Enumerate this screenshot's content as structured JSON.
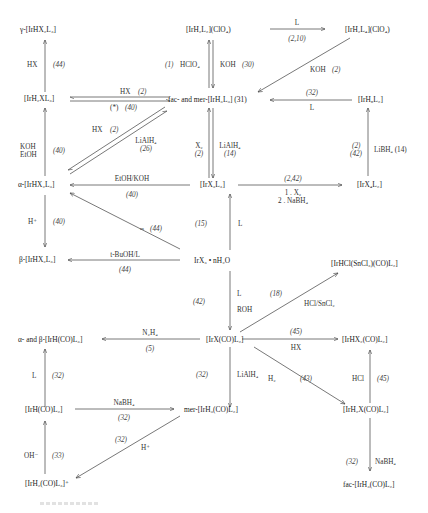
{
  "diagram": {
    "nodes": {
      "gamma_IrHX2L3": "γ-[IrHX₂L₃]",
      "IrH2L2_ClO4": "[IrH₂L₂](ClO₄)",
      "IrH2L4_ClO4": "[IrH₂L₄](ClO₄)",
      "IrH2XL3": "[IrH₂XL₃]",
      "fac_mer_IrH3L3": "fac- and mer-[IrH₃L₃] (31)",
      "IrH5L2": "[IrH₅L₂]",
      "alpha_IrHX2L3": "α-[IrHX₂L₃]",
      "IrX3L3": "[IrX₃L₃]",
      "IrX4L2": "[IrX₄L₂]",
      "beta_IrHX2L3": "β-[IrHX₂L₃]",
      "IrX3_nH2O": "IrX₃ • nH₂O",
      "IrHCl_SnCl3_CO_L2": "[IrHCl(SnCl₃)(CO)L₂]",
      "alpha_beta_IrH_CO_L3": "α- and β-[IrH(CO)L₃]",
      "IrX_CO_L2": "[IrX(CO)L₂]",
      "IrHX2_CO_L2": "[IrHX₂(CO)L₂]",
      "IrH_CO_L2": "[IrH(CO)L₂]",
      "mer_IrH3_CO_L2": "mer-[IrH₃(CO)L₂]",
      "IrH2X_CO_L2": "[IrH₂X(CO)L₂]",
      "IrH2_CO_L3_plus": "[IrH₂(CO)L₃]⁺",
      "fac_IrH3_CO_L2": "fac-[IrH₃(CO)L₂]"
    },
    "edges": {
      "hx_44_top": {
        "reagent": "HX",
        "ref": "(44)"
      },
      "hclo4_1": {
        "reagent": "HClO₄",
        "ref": "(1)"
      },
      "koh_30": {
        "reagent": "KOH",
        "ref": "(30)"
      },
      "l_2_10": {
        "reagent": "L",
        "ref": "(2,10)"
      },
      "koh_2": {
        "reagent": "KOH",
        "ref": "(2)"
      },
      "hx_2_top": {
        "reagent": "HX",
        "ref": "(2)"
      },
      "star_40": {
        "reagent": "(*)",
        "ref": "(40)"
      },
      "l_32": {
        "reagent": "L",
        "ref": "(32)"
      },
      "hx_2_diag": {
        "reagent": "HX",
        "ref": "(2)"
      },
      "lialh4_26": {
        "reagent": "LiAlH₄",
        "ref": "(26)"
      },
      "koh_etoh_40": {
        "reagent1": "KOH",
        "reagent2": "EtOH",
        "ref": "(40)"
      },
      "x2_2": {
        "reagent": "X₂",
        "ref": "(2)"
      },
      "lialh4_14": {
        "reagent": "LiAlH₄",
        "ref": "(14)"
      },
      "libh4_14": {
        "reagent": "LiBH₄ (14)",
        "ref1": "(2)",
        "ref2": "(42)"
      },
      "etoh_koh_40": {
        "reagent": "EtOH/KOH",
        "ref": "(40)"
      },
      "x2_nabh4": {
        "ref": "(2,42)",
        "step1": "1 . X₂",
        "step2": "2 . NaBH₄"
      },
      "hplus_40": {
        "reagent": "H⁺",
        "ref": "(40)"
      },
      "diag_44": {
        "reagent": "m",
        "ref": "(44)"
      },
      "l_15": {
        "reagent": "L",
        "ref": "(15)"
      },
      "tbuoh_44": {
        "reagent": "t-BuOH/L",
        "ref": "(44)"
      },
      "l_roh_42": {
        "reagent1": "L",
        "reagent2": "ROH",
        "ref": "(42)"
      },
      "hcl_sncl2_18": {
        "reagent": "HCl/SnCl₂",
        "ref": "(18)"
      },
      "n2h4_5": {
        "reagent": "N₂H₄",
        "ref": "(5)"
      },
      "hx_45": {
        "reagent": "HX",
        "ref": "(45)"
      },
      "l_32_left": {
        "reagent": "L",
        "ref": "(32)"
      },
      "lialh4_32": {
        "reagent": "LiAlH₄",
        "ref": "(32)"
      },
      "h2_43": {
        "reagent": "H₂",
        "ref": "(43)"
      },
      "hcl_45": {
        "reagent": "HCl",
        "ref": "(45)"
      },
      "nabh4_32": {
        "reagent": "NaBH₄",
        "ref": "(32)"
      },
      "hplus_32": {
        "reagent": "H⁺",
        "ref": "(32)"
      },
      "oh_33": {
        "reagent": "OH⁻",
        "ref": "(33)"
      },
      "nabh4_32_right": {
        "reagent": "NaBH₄",
        "ref": "(32)"
      }
    }
  }
}
